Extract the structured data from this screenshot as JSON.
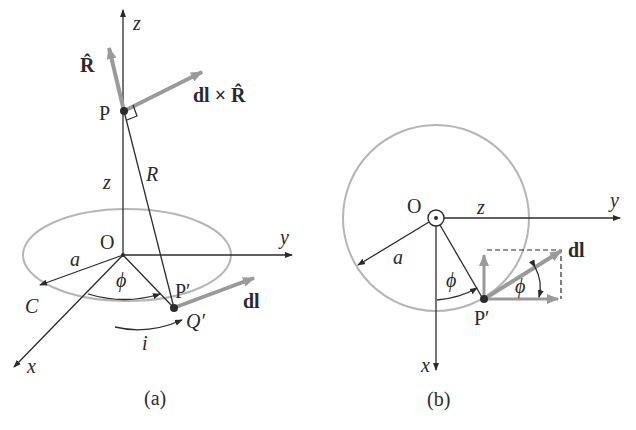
{
  "figure": {
    "panel_a": {
      "caption": "(a)",
      "labels": {
        "z_axis": "z",
        "y_axis": "y",
        "x_axis": "x",
        "R_hat": "R̂",
        "dl_cross_R": "dl × R̂",
        "point_P": "P",
        "distance_R": "R",
        "height_z": "z",
        "origin": "O",
        "radius": "a",
        "angle": "ϕ",
        "point_P_prime": "P′",
        "point_Q_prime": "Q′",
        "loop_C": "C",
        "current": "i",
        "dl": "dl"
      }
    },
    "panel_b": {
      "caption": "(b)",
      "labels": {
        "origin": "O",
        "z_out": "z",
        "y_axis": "y",
        "x_axis": "x",
        "radius": "a",
        "angle": "ϕ",
        "angle_dl": "ϕ",
        "point_P_prime": "P′",
        "dl": "dl"
      }
    },
    "colors": {
      "line": "#2b2b2b",
      "vector_gray": "#9a9a9a",
      "loop_gray": "#b5b5b5"
    }
  }
}
